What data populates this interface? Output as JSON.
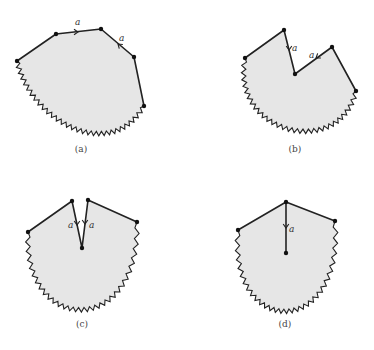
{
  "figure": {
    "panels": [
      {
        "id": "a",
        "caption": "(a)",
        "caption_pos": [
          81,
          152
        ],
        "vertices": [
          [
            17,
            61
          ],
          [
            56,
            34
          ],
          [
            101,
            29
          ],
          [
            134,
            57
          ],
          [
            144,
            106
          ]
        ],
        "arc": {
          "from": [
            144,
            106
          ],
          "to": [
            17,
            61
          ],
          "ctrl": [
            110,
            165
          ],
          "ctrl2": [
            30,
            120
          ]
        },
        "edge_labels": [
          {
            "text": "a",
            "pos": [
              75,
              25
            ],
            "arrow": {
              "at": [
                78,
                32
              ],
              "dir": "right"
            }
          },
          {
            "text": "a",
            "pos": [
              119,
              41
            ],
            "arrow": {
              "at": [
                118,
                44
              ],
              "dir": "up-left"
            }
          }
        ]
      },
      {
        "id": "b",
        "caption": "(b)",
        "caption_pos": [
          295,
          152
        ],
        "vertices": [
          [
            245,
            58
          ],
          [
            284,
            30
          ],
          [
            295,
            74
          ],
          [
            332,
            47
          ],
          [
            356,
            91
          ]
        ],
        "arc": {
          "from": [
            356,
            91
          ],
          "to": [
            245,
            58
          ],
          "ctrl": [
            340,
            160
          ],
          "ctrl2": [
            230,
            135
          ]
        },
        "edge_labels": [
          {
            "text": "a",
            "pos": [
              292,
              51
            ],
            "arrow": {
              "at": [
                289,
                50
              ],
              "dir": "down"
            }
          },
          {
            "text": "a",
            "pos": [
              309,
              58
            ],
            "arrow": {
              "at": [
                316,
                58
              ],
              "dir": "down-left"
            }
          }
        ]
      },
      {
        "id": "c",
        "caption": "(c)",
        "caption_pos": [
          82,
          327
        ],
        "vertices": [
          [
            28,
            232
          ],
          [
            72,
            201
          ],
          [
            82,
            248
          ],
          [
            88,
            200
          ],
          [
            137,
            222
          ]
        ],
        "arc": {
          "from": [
            137,
            222
          ],
          "to": [
            28,
            232
          ],
          "ctrl": [
            140,
            340
          ],
          "ctrl2": [
            22,
            335
          ]
        },
        "edge_labels": [
          {
            "text": "a",
            "pos": [
              68,
              228
            ],
            "arrow": {
              "at": [
                77,
                225
              ],
              "dir": "down"
            }
          },
          {
            "text": "a",
            "pos": [
              89,
              228
            ],
            "arrow": {
              "at": [
                85,
                224
              ],
              "dir": "down"
            }
          }
        ]
      },
      {
        "id": "d",
        "caption": "(d)",
        "caption_pos": [
          285,
          327
        ],
        "vertices": [
          [
            238,
            230
          ],
          [
            286,
            202
          ],
          [
            335,
            221
          ]
        ],
        "center": [
          286,
          253
        ],
        "arc": {
          "from": [
            335,
            221
          ],
          "to": [
            238,
            230
          ],
          "ctrl": [
            345,
            340
          ],
          "ctrl2": [
            228,
            340
          ]
        },
        "edge_labels": [
          {
            "text": "a",
            "pos": [
              289,
              232
            ],
            "arrow": {
              "at": [
                286,
                228
              ],
              "dir": "down"
            }
          }
        ]
      }
    ]
  }
}
